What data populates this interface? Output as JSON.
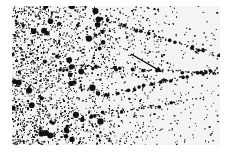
{
  "figure": {
    "kind": "grayscale micrograph",
    "frame": {
      "x": 12,
      "y": 6,
      "width": 208,
      "height": 139
    },
    "background": "#f4f4f4",
    "ink": "#111111",
    "density_gradient": "dense on the left, sparse on the right",
    "tracks": [
      {
        "from": [
          85,
          12
        ],
        "to": [
          208,
          50
        ]
      },
      {
        "from": [
          60,
          60
        ],
        "to": [
          208,
          68
        ]
      },
      {
        "from": [
          90,
          90
        ],
        "to": [
          208,
          62
        ]
      },
      {
        "from": [
          40,
          116
        ],
        "to": [
          208,
          90
        ]
      }
    ],
    "arrow": {
      "from": [
        119,
        48
      ],
      "to": [
        150,
        66
      ],
      "color": "#000000"
    }
  }
}
